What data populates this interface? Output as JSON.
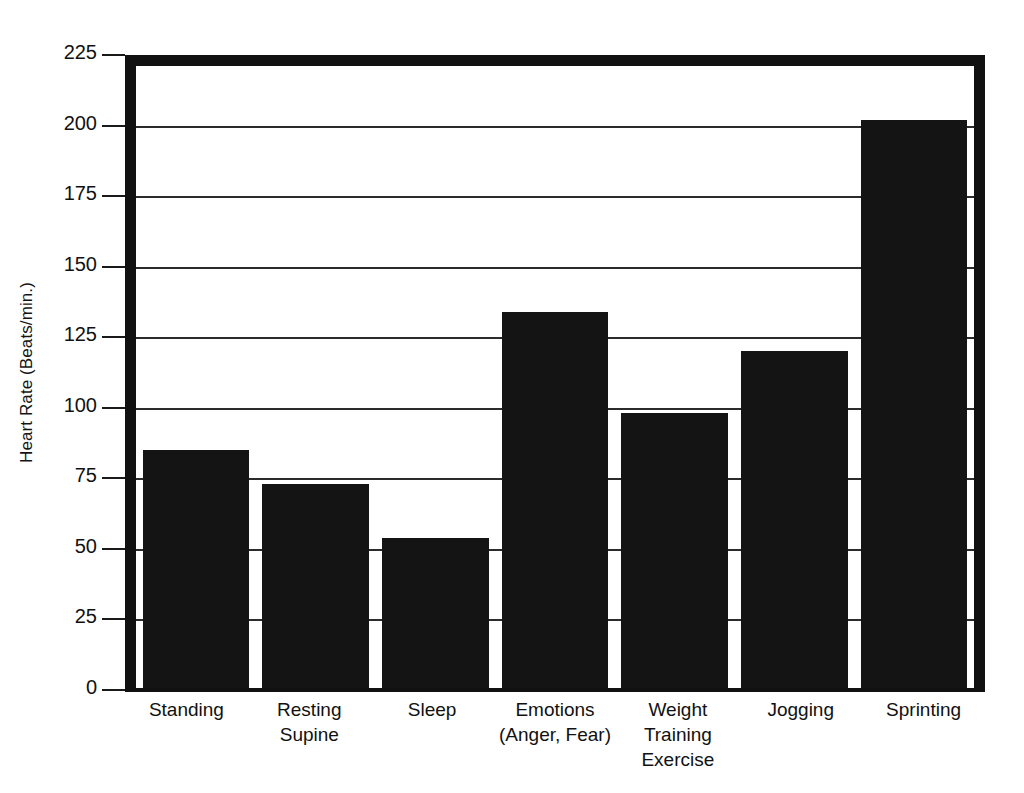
{
  "chart_data": {
    "type": "bar",
    "title": "",
    "subtitle": "",
    "xlabel": "",
    "ylabel": "Heart Rate (Beats/min.)",
    "ylim": [
      0,
      225
    ],
    "ytick_interval": 25,
    "yticks": [
      "225",
      "200",
      "175",
      "150",
      "125",
      "100",
      "75",
      "50",
      "25",
      "0"
    ],
    "ytick_values": [
      225,
      200,
      175,
      150,
      125,
      100,
      75,
      50,
      25,
      0
    ],
    "gridlines": true,
    "legend": null,
    "legend_position": "none",
    "bar_color": "#141414",
    "background_color": "#ffffff",
    "frame_color": "#111111",
    "gridline_color": "#2b2b2b",
    "categories": [
      "Standing",
      "Resting Supine",
      "Sleep",
      "Emotions (Anger, Fear)",
      "Weight Training Exercise",
      "Jogging",
      "Sprinting"
    ],
    "category_label_lines": [
      [
        "Standing"
      ],
      [
        "Resting",
        "Supine"
      ],
      [
        "Sleep"
      ],
      [
        "Emotions",
        "(Anger, Fear)"
      ],
      [
        "Weight",
        "Training",
        "Exercise"
      ],
      [
        "Jogging"
      ],
      [
        "Sprinting"
      ]
    ],
    "values": [
      85,
      73,
      54,
      134,
      98,
      120,
      202
    ],
    "bars": [
      {
        "category": "Standing",
        "value": 85
      },
      {
        "category": "Resting Supine",
        "value": 73
      },
      {
        "category": "Sleep",
        "value": 54
      },
      {
        "category": "Emotions (Anger, Fear)",
        "value": 134
      },
      {
        "category": "Weight Training Exercise",
        "value": 98
      },
      {
        "category": "Jogging",
        "value": 120
      },
      {
        "category": "Sprinting",
        "value": 202
      }
    ]
  }
}
